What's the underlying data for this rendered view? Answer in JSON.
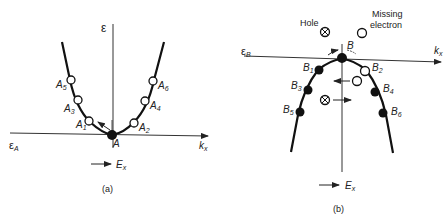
{
  "panel_a": {
    "caption": "(a)",
    "energy_axis_label": "ε",
    "band_edge_label": "ε",
    "band_edge_sub": "A",
    "k_axis_label": "k",
    "k_axis_sub": "x",
    "field_label": "E",
    "field_sub": "x",
    "center_point_label": "A",
    "states": [
      {
        "name": "A",
        "sub": "1",
        "filled": false
      },
      {
        "name": "A",
        "sub": "2",
        "filled": false
      },
      {
        "name": "A",
        "sub": "3",
        "filled": false
      },
      {
        "name": "A",
        "sub": "4",
        "filled": false
      },
      {
        "name": "A",
        "sub": "5",
        "filled": false
      },
      {
        "name": "A",
        "sub": "6",
        "filled": false
      }
    ]
  },
  "panel_b": {
    "caption": "(b)",
    "band_edge_label": "ε",
    "band_edge_sub": "B",
    "k_axis_label": "k",
    "k_axis_sub": "x",
    "field_label": "E",
    "field_sub": "x",
    "center_point_label": "B",
    "hole_label": "Hole",
    "missing_label_line1": "Missing",
    "missing_label_line2": "electron",
    "states": [
      {
        "name": "B",
        "sub": "1",
        "filled": true
      },
      {
        "name": "B",
        "sub": "2",
        "filled": false
      },
      {
        "name": "B",
        "sub": "3",
        "filled": true
      },
      {
        "name": "B",
        "sub": "4",
        "filled": true
      },
      {
        "name": "B",
        "sub": "5",
        "filled": true
      },
      {
        "name": "B",
        "sub": "6",
        "filled": true
      }
    ]
  }
}
